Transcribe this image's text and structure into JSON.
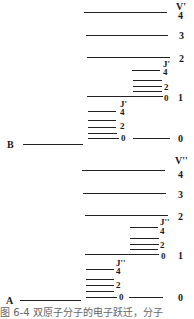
{
  "figure": {
    "caption": "图 6-4  双原子分子的电子跃迁，分子"
  },
  "upper_state": {
    "electronic_label": "B",
    "vib_header": "V'",
    "vib_levels": [
      "4",
      "3",
      "2",
      "1",
      "0"
    ],
    "rot_header": "J'",
    "rot_labels_v1": [
      "4",
      "2",
      "0"
    ],
    "rot_labels_v0": [
      "4",
      "2",
      "0"
    ]
  },
  "lower_state": {
    "electronic_label": "A",
    "vib_header": "V''",
    "vib_levels": [
      "4",
      "3",
      "2",
      "1",
      "0"
    ],
    "rot_header": "J''",
    "rot_labels_v1": [
      "4",
      "2",
      "0"
    ],
    "rot_labels_v0": [
      "4",
      "2",
      "0"
    ]
  }
}
